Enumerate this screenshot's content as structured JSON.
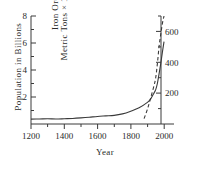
{
  "chart_data": {
    "type": "line",
    "title": "",
    "xlabel": "Year",
    "ylabel": "Population  in  Billions",
    "ylabel_right_line1": "Iron Ore",
    "ylabel_right_line2": "Metric Tons × 1 million",
    "xlim": [
      1200,
      2060
    ],
    "ylim": [
      0,
      8
    ],
    "ylim_right": [
      0,
      700
    ],
    "xticks": [
      1200,
      1400,
      1600,
      1800,
      2000
    ],
    "xticklabels": [
      "1200",
      "1400",
      "1600",
      "1800",
      "2000"
    ],
    "xminorticks": [
      1300,
      1500,
      1700,
      1900
    ],
    "yticks": [
      2,
      4,
      6,
      8
    ],
    "yticklabels": [
      "2",
      "4",
      "6",
      "8"
    ],
    "yminorticks": [
      1,
      3,
      5,
      7
    ],
    "yticks_right": [
      200,
      400,
      600
    ],
    "yticklabels_right": [
      "200",
      "400",
      "600"
    ],
    "yminorticks_right": [
      100,
      300,
      500
    ],
    "grid": false,
    "legend": "none",
    "series": [
      {
        "name": "Population",
        "style": "solid",
        "axis": "left",
        "color": "#3a3a3a",
        "x": [
          1200,
          1250,
          1300,
          1350,
          1400,
          1450,
          1500,
          1550,
          1600,
          1650,
          1700,
          1750,
          1800,
          1850,
          1900,
          1920,
          1940,
          1950,
          1960,
          1970,
          1980,
          1990,
          2000
        ],
        "y": [
          0.36,
          0.37,
          0.39,
          0.37,
          0.39,
          0.41,
          0.45,
          0.5,
          0.56,
          0.6,
          0.64,
          0.75,
          0.95,
          1.2,
          1.6,
          1.86,
          2.3,
          2.55,
          3.0,
          3.7,
          4.45,
          5.3,
          6.1
        ]
      },
      {
        "name": "Iron Ore",
        "style": "dashed",
        "axis": "right",
        "color": "#3a3a3a",
        "x": [
          1880,
          1900,
          1920,
          1940,
          1950,
          1960,
          1970,
          1980,
          1990,
          2000
        ],
        "y": [
          35,
          95,
          170,
          250,
          300,
          390,
          500,
          580,
          650,
          700
        ]
      }
    ]
  }
}
